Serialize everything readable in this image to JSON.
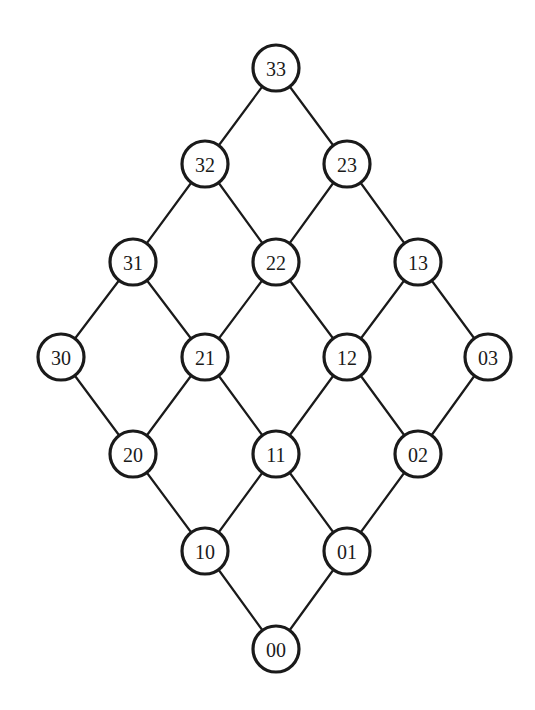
{
  "diagram": {
    "type": "lattice",
    "style": {
      "stroke_color": "#1a1a1a",
      "node_fill": "#ffffff",
      "background": "#ffffff",
      "node_radius": 23
    },
    "nodes": [
      {
        "id": "33",
        "label": "33",
        "x": 276,
        "y": 68
      },
      {
        "id": "32",
        "label": "32",
        "x": 205,
        "y": 164
      },
      {
        "id": "23",
        "label": "23",
        "x": 347,
        "y": 164
      },
      {
        "id": "31",
        "label": "31",
        "x": 133,
        "y": 262
      },
      {
        "id": "22",
        "label": "22",
        "x": 276,
        "y": 262
      },
      {
        "id": "13",
        "label": "13",
        "x": 418,
        "y": 262
      },
      {
        "id": "30",
        "label": "30",
        "x": 61,
        "y": 357
      },
      {
        "id": "21",
        "label": "21",
        "x": 205,
        "y": 357
      },
      {
        "id": "12",
        "label": "12",
        "x": 347,
        "y": 357
      },
      {
        "id": "03",
        "label": "03",
        "x": 488,
        "y": 357
      },
      {
        "id": "20",
        "label": "20",
        "x": 133,
        "y": 454
      },
      {
        "id": "11",
        "label": "11",
        "x": 276,
        "y": 454
      },
      {
        "id": "02",
        "label": "02",
        "x": 418,
        "y": 454
      },
      {
        "id": "10",
        "label": "10",
        "x": 205,
        "y": 551
      },
      {
        "id": "01",
        "label": "01",
        "x": 347,
        "y": 551
      },
      {
        "id": "00",
        "label": "00",
        "x": 276,
        "y": 649
      }
    ],
    "edges": [
      [
        "33",
        "32"
      ],
      [
        "33",
        "23"
      ],
      [
        "32",
        "31"
      ],
      [
        "32",
        "22"
      ],
      [
        "23",
        "22"
      ],
      [
        "23",
        "13"
      ],
      [
        "31",
        "30"
      ],
      [
        "31",
        "21"
      ],
      [
        "22",
        "21"
      ],
      [
        "22",
        "12"
      ],
      [
        "13",
        "12"
      ],
      [
        "13",
        "03"
      ],
      [
        "30",
        "20"
      ],
      [
        "21",
        "20"
      ],
      [
        "21",
        "11"
      ],
      [
        "12",
        "11"
      ],
      [
        "12",
        "02"
      ],
      [
        "03",
        "02"
      ],
      [
        "20",
        "10"
      ],
      [
        "11",
        "10"
      ],
      [
        "11",
        "01"
      ],
      [
        "02",
        "01"
      ],
      [
        "10",
        "00"
      ],
      [
        "01",
        "00"
      ]
    ]
  }
}
